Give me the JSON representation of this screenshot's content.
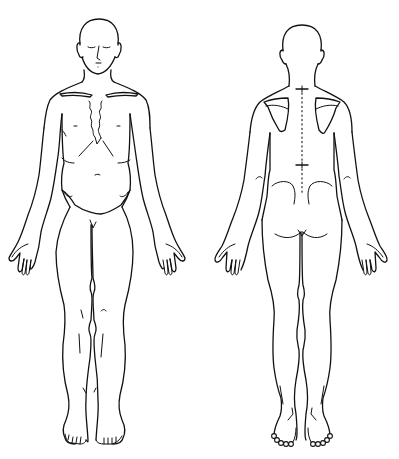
{
  "diagram": {
    "type": "body-outline-chart",
    "background": "#ffffff",
    "line_color": "#111111",
    "views": [
      {
        "id": "anterior",
        "label": "front view",
        "position": "left"
      },
      {
        "id": "posterior",
        "label": "back view",
        "position": "right"
      }
    ],
    "markers": {
      "spine_cross_marks": 2,
      "spine_dotted_line": true
    }
  }
}
